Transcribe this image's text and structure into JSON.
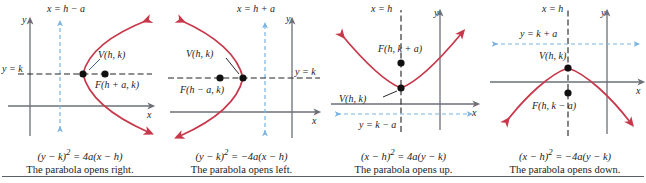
{
  "figure": {
    "type": "four-panel-parabola-diagram",
    "divider": true,
    "colors": {
      "curve": "#c8384b",
      "axis": "#6b6f76",
      "directrix_blue": "#7ab3e0",
      "directrix_black": "#222222",
      "text": "#1c1c1c"
    }
  },
  "panels": [
    {
      "id": "opens-right",
      "axis_y_label": "y",
      "axis_x_label": "x",
      "directrix_label": "x = h − a",
      "axis_line_label": "y = k",
      "vertex_label": "V(h, k)",
      "focus_label": "F(h + a, k)",
      "equation_left": "(y − k)",
      "equation_exp": "2",
      "equation_right": " = 4a(x − h)",
      "description": "The parabola opens right."
    },
    {
      "id": "opens-left",
      "axis_y_label": "y",
      "axis_x_label": "x",
      "directrix_label": "x = h + a",
      "axis_line_label": "y = k",
      "vertex_label": "V(h, k)",
      "focus_label": "F(h − a, k)",
      "equation_left": "(y − k)",
      "equation_exp": "2",
      "equation_right": " = −4a(x − h)",
      "description": "The parabola opens left."
    },
    {
      "id": "opens-up",
      "axis_y_label": "y",
      "axis_x_label": "x",
      "directrix_label": "x = h",
      "axis_line_label": "y = k − a",
      "vertex_label": "V(h, k)",
      "focus_label": "F(h, k + a)",
      "equation_left": "(x − h)",
      "equation_exp": "2",
      "equation_right": " = 4a(y − k)",
      "description": "The parabola opens up."
    },
    {
      "id": "opens-down",
      "axis_y_label": "y",
      "axis_x_label": "x",
      "directrix_label": "x = h",
      "axis_line_label": "y = k + a",
      "vertex_label": "V(h, k)",
      "focus_label": "F(h, k − a)",
      "equation_left": "(x − h)",
      "equation_exp": "2",
      "equation_right": " = −4a(y − k)",
      "description": "The parabola opens down."
    }
  ]
}
